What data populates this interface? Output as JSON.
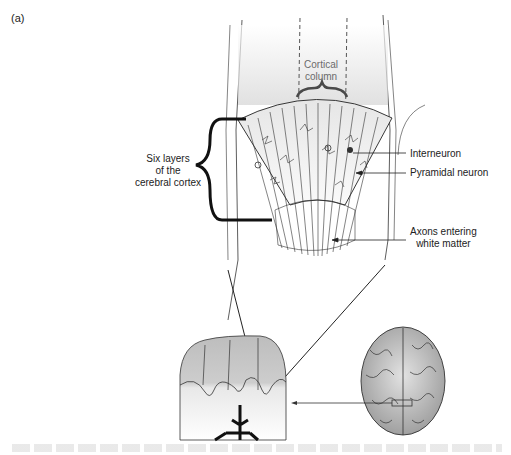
{
  "figure": {
    "panel_label": "(a)",
    "labels": {
      "cortical_column": "Cortical column",
      "six_layers": "Six layers of the cerebral cortex",
      "interneuron": "Interneuron",
      "pyramidal_neuron": "Pyramidal neuron",
      "axons": "Axons entering white matter"
    },
    "label_lines": {
      "cortical_column": [
        "Cortical",
        "column"
      ],
      "six_layers": [
        "Six layers",
        "of the",
        "cerebral cortex"
      ],
      "axons": [
        "Axons entering",
        "white matter"
      ]
    },
    "colors": {
      "cortical_column_text": "#6b6b6b",
      "brace_column": "#4a4a4a",
      "brace_layers": "#111111",
      "gray_matter": "#c8c8c8",
      "line": "#222222"
    },
    "caption": "(caption text cut off, illegible)"
  }
}
